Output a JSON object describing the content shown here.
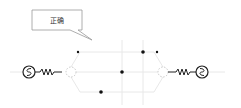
{
  "callout": {
    "text": "正确",
    "box": {
      "x": 32,
      "y": 10,
      "w": 50,
      "h": 20
    },
    "tail_tip": {
      "x": 92,
      "y": 40
    }
  },
  "colors": {
    "wire": "#e6e6e6",
    "component": "#222222",
    "dot": "#111111",
    "dashed_node": "#bbbbbb",
    "callout_border": "#888888"
  },
  "components": [
    {
      "type": "ac-source",
      "name": "left-ac-source",
      "cx": 29,
      "cy": 72,
      "r": 6
    },
    {
      "type": "resistor",
      "name": "left-resistor",
      "x1": 36,
      "x2": 62,
      "y": 72
    },
    {
      "type": "dashed-node",
      "name": "left-node",
      "cx": 71,
      "cy": 72,
      "r": 5
    },
    {
      "type": "dashed-node",
      "name": "right-node",
      "cx": 163,
      "cy": 72,
      "r": 5
    },
    {
      "type": "resistor",
      "name": "right-resistor",
      "x1": 170,
      "x2": 196,
      "y": 72
    },
    {
      "type": "ac-source",
      "name": "right-ac-source",
      "cx": 202,
      "cy": 72,
      "r": 6
    }
  ],
  "dots": [
    {
      "x": 78,
      "y": 52,
      "r": 1.2
    },
    {
      "x": 143,
      "y": 52,
      "r": 1.8
    },
    {
      "x": 157,
      "y": 52,
      "r": 1.2
    },
    {
      "x": 122,
      "y": 72,
      "r": 1.8
    },
    {
      "x": 101,
      "y": 92,
      "r": 1.8
    }
  ]
}
